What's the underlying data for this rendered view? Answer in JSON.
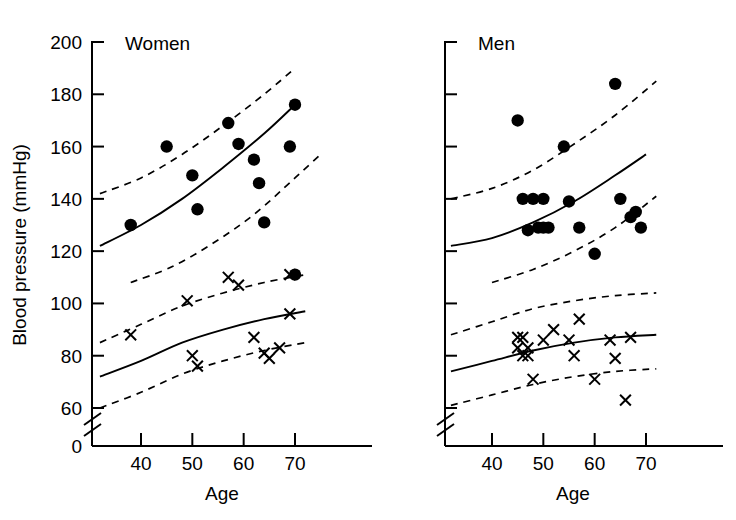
{
  "figure": {
    "y_axis_label": "Blood pressure (mmHg)",
    "x_axis_label": "Age",
    "y_ticks": [
      0,
      60,
      80,
      100,
      120,
      140,
      160,
      180,
      200
    ],
    "x_ticks": [
      40,
      50,
      60,
      70
    ],
    "axis_break": true,
    "panels": [
      {
        "title": "Women"
      },
      {
        "title": "Men"
      }
    ]
  },
  "chart_data": {
    "type": "scatter",
    "title": "",
    "xlabel": "Age",
    "ylabel": "Blood pressure (mmHg)",
    "xlim": [
      30,
      78
    ],
    "ylim": [
      55,
      200
    ],
    "ylim_break": [
      0,
      60
    ],
    "grid": false,
    "legend": "none",
    "x_ticks": [
      40,
      50,
      60,
      70
    ],
    "y_ticks": [
      0,
      60,
      80,
      100,
      120,
      140,
      160,
      180,
      200
    ],
    "panels": [
      {
        "name": "Women",
        "series": [
          {
            "name": "Systolic blood pressure",
            "marker": "filled-circle",
            "points": [
              {
                "x": 38,
                "y": 130
              },
              {
                "x": 45,
                "y": 160
              },
              {
                "x": 50,
                "y": 149
              },
              {
                "x": 51,
                "y": 136
              },
              {
                "x": 57,
                "y": 169
              },
              {
                "x": 59,
                "y": 161
              },
              {
                "x": 62,
                "y": 155
              },
              {
                "x": 63,
                "y": 146
              },
              {
                "x": 64,
                "y": 131
              },
              {
                "x": 69,
                "y": 160
              },
              {
                "x": 70,
                "y": 176
              },
              {
                "x": 70,
                "y": 111
              }
            ],
            "fit_line": {
              "style": "solid",
              "points": [
                {
                  "x": 32,
                  "y": 122
                },
                {
                  "x": 40,
                  "y": 130
                },
                {
                  "x": 48,
                  "y": 140
                },
                {
                  "x": 56,
                  "y": 152
                },
                {
                  "x": 64,
                  "y": 165
                },
                {
                  "x": 70,
                  "y": 176
                }
              ]
            },
            "upper_bound": {
              "style": "dashed",
              "points": [
                {
                  "x": 32,
                  "y": 142
                },
                {
                  "x": 40,
                  "y": 148
                },
                {
                  "x": 48,
                  "y": 157
                },
                {
                  "x": 56,
                  "y": 168
                },
                {
                  "x": 64,
                  "y": 180
                },
                {
                  "x": 70,
                  "y": 190
                }
              ]
            },
            "lower_bound": {
              "style": "dashed",
              "points": [
                {
                  "x": 38,
                  "y": 108
                },
                {
                  "x": 46,
                  "y": 114
                },
                {
                  "x": 54,
                  "y": 123
                },
                {
                  "x": 62,
                  "y": 134
                },
                {
                  "x": 70,
                  "y": 148
                },
                {
                  "x": 75,
                  "y": 157
                }
              ]
            }
          },
          {
            "name": "Diastolic blood pressure",
            "marker": "cross",
            "points": [
              {
                "x": 38,
                "y": 88
              },
              {
                "x": 49,
                "y": 101
              },
              {
                "x": 50,
                "y": 80
              },
              {
                "x": 51,
                "y": 76
              },
              {
                "x": 57,
                "y": 110
              },
              {
                "x": 59,
                "y": 107
              },
              {
                "x": 62,
                "y": 87
              },
              {
                "x": 64,
                "y": 81
              },
              {
                "x": 65,
                "y": 79
              },
              {
                "x": 67,
                "y": 83
              },
              {
                "x": 69,
                "y": 111
              },
              {
                "x": 69,
                "y": 96
              }
            ],
            "fit_line": {
              "style": "solid",
              "points": [
                {
                  "x": 32,
                  "y": 72
                },
                {
                  "x": 40,
                  "y": 78
                },
                {
                  "x": 48,
                  "y": 85
                },
                {
                  "x": 56,
                  "y": 90
                },
                {
                  "x": 64,
                  "y": 94
                },
                {
                  "x": 72,
                  "y": 97
                }
              ]
            },
            "upper_bound": {
              "style": "dashed",
              "points": [
                {
                  "x": 32,
                  "y": 85
                },
                {
                  "x": 40,
                  "y": 92
                },
                {
                  "x": 48,
                  "y": 99
                },
                {
                  "x": 56,
                  "y": 104
                },
                {
                  "x": 64,
                  "y": 108
                },
                {
                  "x": 72,
                  "y": 111
                }
              ]
            },
            "lower_bound": {
              "style": "dashed",
              "points": [
                {
                  "x": 32,
                  "y": 60
                },
                {
                  "x": 40,
                  "y": 66
                },
                {
                  "x": 48,
                  "y": 73
                },
                {
                  "x": 56,
                  "y": 78
                },
                {
                  "x": 64,
                  "y": 82
                },
                {
                  "x": 72,
                  "y": 85
                }
              ]
            }
          }
        ]
      },
      {
        "name": "Men",
        "series": [
          {
            "name": "Systolic blood pressure",
            "marker": "filled-circle",
            "points": [
              {
                "x": 45,
                "y": 170
              },
              {
                "x": 46,
                "y": 140
              },
              {
                "x": 47,
                "y": 128
              },
              {
                "x": 48,
                "y": 140
              },
              {
                "x": 49,
                "y": 129
              },
              {
                "x": 50,
                "y": 140
              },
              {
                "x": 50,
                "y": 129
              },
              {
                "x": 51,
                "y": 129
              },
              {
                "x": 54,
                "y": 160
              },
              {
                "x": 55,
                "y": 139
              },
              {
                "x": 57,
                "y": 129
              },
              {
                "x": 60,
                "y": 119
              },
              {
                "x": 64,
                "y": 184
              },
              {
                "x": 65,
                "y": 140
              },
              {
                "x": 67,
                "y": 133
              },
              {
                "x": 68,
                "y": 135
              },
              {
                "x": 69,
                "y": 129
              }
            ],
            "fit_line": {
              "style": "solid",
              "points": [
                {
                  "x": 32,
                  "y": 122
                },
                {
                  "x": 40,
                  "y": 125
                },
                {
                  "x": 48,
                  "y": 131
                },
                {
                  "x": 56,
                  "y": 139
                },
                {
                  "x": 64,
                  "y": 149
                },
                {
                  "x": 70,
                  "y": 157
                }
              ]
            },
            "upper_bound": {
              "style": "dashed",
              "points": [
                {
                  "x": 32,
                  "y": 140
                },
                {
                  "x": 40,
                  "y": 144
                },
                {
                  "x": 48,
                  "y": 151
                },
                {
                  "x": 56,
                  "y": 161
                },
                {
                  "x": 64,
                  "y": 172
                },
                {
                  "x": 72,
                  "y": 185
                }
              ]
            },
            "lower_bound": {
              "style": "dashed",
              "points": [
                {
                  "x": 40,
                  "y": 108
                },
                {
                  "x": 48,
                  "y": 113
                },
                {
                  "x": 56,
                  "y": 120
                },
                {
                  "x": 64,
                  "y": 129
                },
                {
                  "x": 72,
                  "y": 141
                }
              ]
            }
          },
          {
            "name": "Diastolic blood pressure",
            "marker": "cross",
            "points": [
              {
                "x": 45,
                "y": 87
              },
              {
                "x": 45,
                "y": 83
              },
              {
                "x": 46,
                "y": 80
              },
              {
                "x": 46,
                "y": 87
              },
              {
                "x": 47,
                "y": 83
              },
              {
                "x": 47,
                "y": 80
              },
              {
                "x": 48,
                "y": 71
              },
              {
                "x": 50,
                "y": 86
              },
              {
                "x": 52,
                "y": 90
              },
              {
                "x": 55,
                "y": 86
              },
              {
                "x": 56,
                "y": 80
              },
              {
                "x": 57,
                "y": 94
              },
              {
                "x": 60,
                "y": 71
              },
              {
                "x": 63,
                "y": 86
              },
              {
                "x": 64,
                "y": 79
              },
              {
                "x": 66,
                "y": 63
              },
              {
                "x": 67,
                "y": 87
              }
            ],
            "fit_line": {
              "style": "solid",
              "points": [
                {
                  "x": 32,
                  "y": 74
                },
                {
                  "x": 40,
                  "y": 78
                },
                {
                  "x": 48,
                  "y": 82
                },
                {
                  "x": 56,
                  "y": 85
                },
                {
                  "x": 64,
                  "y": 87
                },
                {
                  "x": 72,
                  "y": 88
                }
              ]
            },
            "upper_bound": {
              "style": "dashed",
              "points": [
                {
                  "x": 32,
                  "y": 88
                },
                {
                  "x": 40,
                  "y": 93
                },
                {
                  "x": 48,
                  "y": 98
                },
                {
                  "x": 56,
                  "y": 101
                },
                {
                  "x": 64,
                  "y": 103
                },
                {
                  "x": 72,
                  "y": 104
                }
              ]
            },
            "lower_bound": {
              "style": "dashed",
              "points": [
                {
                  "x": 32,
                  "y": 61
                },
                {
                  "x": 40,
                  "y": 65
                },
                {
                  "x": 48,
                  "y": 69
                },
                {
                  "x": 56,
                  "y": 72
                },
                {
                  "x": 64,
                  "y": 74
                },
                {
                  "x": 72,
                  "y": 75
                }
              ]
            }
          }
        ]
      }
    ]
  }
}
